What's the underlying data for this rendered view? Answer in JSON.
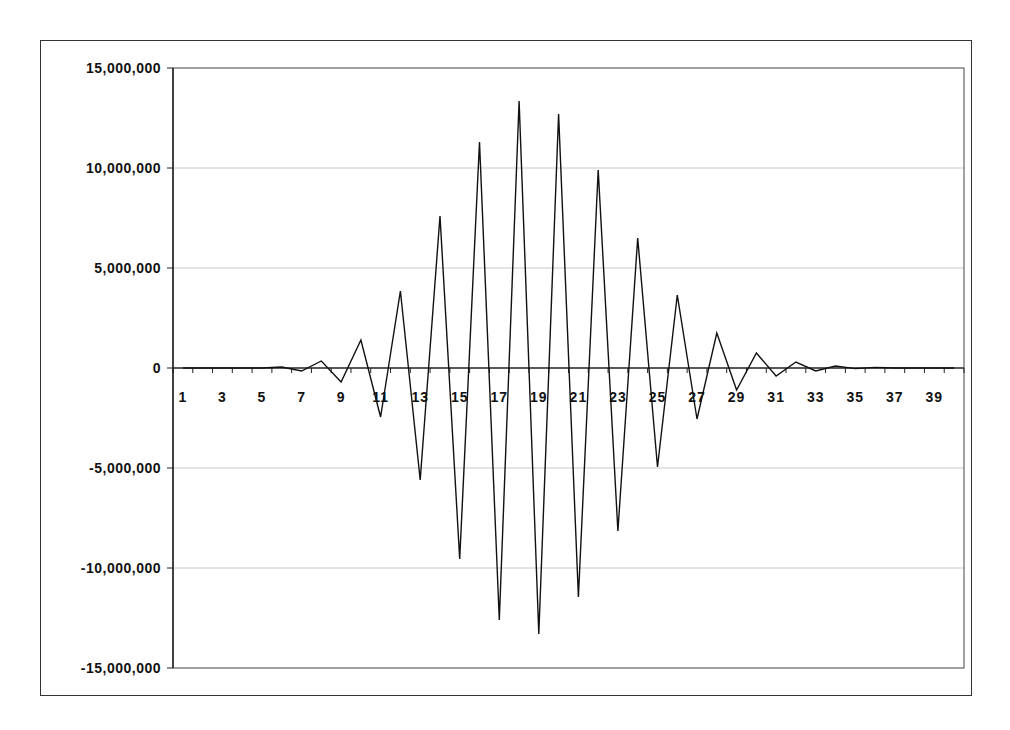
{
  "chart_data": {
    "type": "line",
    "title": "",
    "xlabel": "",
    "ylabel": "",
    "ylim": [
      -15000000,
      15000000
    ],
    "ytick_values": [
      15000000,
      10000000,
      5000000,
      0,
      -5000000,
      -10000000,
      -15000000
    ],
    "ytick_labels": [
      "15,000,000",
      "10,000,000",
      "5,000,000",
      "0",
      "-5,000,000",
      "-10,000,000",
      "-15,000,000"
    ],
    "xtick_labels": [
      "1",
      "3",
      "5",
      "7",
      "9",
      "11",
      "13",
      "15",
      "17",
      "19",
      "21",
      "23",
      "25",
      "27",
      "29",
      "31",
      "33",
      "35",
      "37",
      "39"
    ],
    "grid": "horizontal",
    "legend": "none",
    "categories": [
      1,
      2,
      3,
      4,
      5,
      6,
      7,
      8,
      9,
      10,
      11,
      12,
      13,
      14,
      15,
      16,
      17,
      18,
      19,
      20,
      21,
      22,
      23,
      24,
      25,
      26,
      27,
      28,
      29,
      30,
      31,
      32,
      33,
      34,
      35,
      36,
      37,
      38,
      39,
      40
    ],
    "series": [
      {
        "name": "Series1",
        "color": "#111111",
        "values": [
          0,
          0,
          0,
          0,
          0,
          50000,
          -150000,
          350000,
          -700000,
          1400000,
          -2450000,
          3850000,
          -5600000,
          7600000,
          -9550000,
          11300000,
          -12600000,
          13350000,
          -13300000,
          12700000,
          -11450000,
          9900000,
          -8150000,
          6500000,
          -4950000,
          3650000,
          -2550000,
          1750000,
          -1100000,
          750000,
          -400000,
          300000,
          -150000,
          100000,
          -30000,
          30000,
          0,
          0,
          0,
          0
        ]
      }
    ]
  }
}
